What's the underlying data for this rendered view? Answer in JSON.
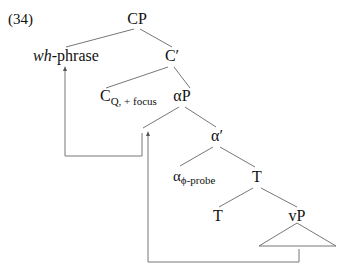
{
  "example_number": "(34)",
  "nodes": {
    "cp": "CP",
    "wh_phrase_italic": "wh",
    "wh_phrase_rest": "-phrase",
    "c_bar": "C′",
    "c_head": "C",
    "c_head_sub": "Q, + focus",
    "alpha_p": "αP",
    "alpha_bar": "α′",
    "alpha_head": "α",
    "alpha_head_sub": "ϕ-probe",
    "t_bar": "T",
    "t_head": "T",
    "vp": "vP"
  },
  "movement_arrows": [
    {
      "from": "spec-alphaP",
      "to": "wh-phrase"
    },
    {
      "from": "vP",
      "to": "spec-alphaP"
    }
  ]
}
